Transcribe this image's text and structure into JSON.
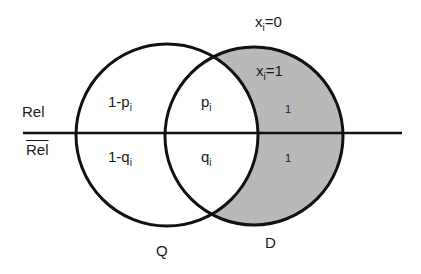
{
  "diagram": {
    "rows": {
      "rel": "Rel",
      "not_rel": "Rel"
    },
    "sets": {
      "q": "Q",
      "d": "D"
    },
    "regions": {
      "q_only_rel": {
        "base": "1-p",
        "sub": "i"
      },
      "q_only_notrel": {
        "base": "1-q",
        "sub": "i"
      },
      "overlap_rel": {
        "base": "p",
        "sub": "i"
      },
      "overlap_notrel": {
        "base": "q",
        "sub": "i"
      },
      "d_only_rel": "1",
      "d_only_notrel": "1"
    },
    "annotations": {
      "outside": {
        "base": "x",
        "sub": "i",
        "rest": "=0"
      },
      "inside_d": {
        "base": "x",
        "sub": "i",
        "rest": "=1"
      }
    },
    "colors": {
      "line": "#111111",
      "shaded": "#b8b8b8",
      "background": "#ffffff"
    }
  }
}
